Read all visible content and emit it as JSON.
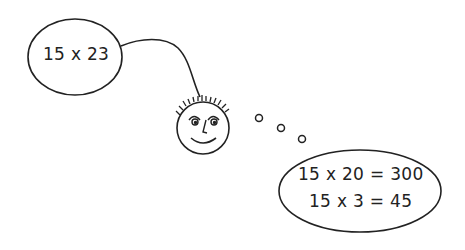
{
  "diagram": {
    "speech_bubble": {
      "text": "15 x 23"
    },
    "thought_bubble": {
      "lines": [
        "15 x 20 = 300",
        "15 x 3 = 45"
      ]
    },
    "character": {
      "description": "smiling face with spiky hair"
    },
    "thought_dots": 3,
    "colors": {
      "stroke": "#222222",
      "background": "#ffffff"
    }
  }
}
